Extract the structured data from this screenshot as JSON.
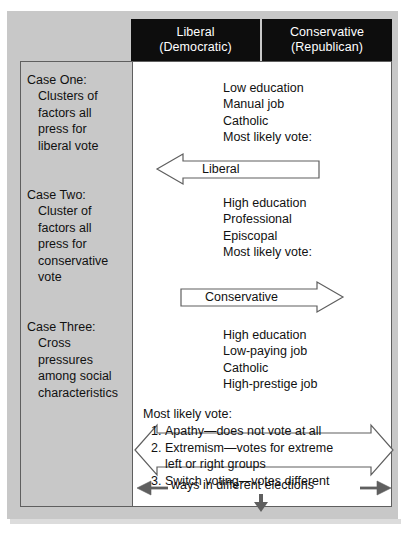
{
  "figure": {
    "colors": {
      "panel_gray": "#c8c8c8",
      "header_black": "#0d0d0d",
      "header_text": "#ffffff",
      "body_white": "#ffffff",
      "line": "#5f5f5f",
      "text": "#111111"
    }
  },
  "header": {
    "columns": [
      {
        "line1": "Liberal",
        "line2": "(Democratic)"
      },
      {
        "line1": "Conservative",
        "line2": "(Republican)"
      }
    ]
  },
  "cases": [
    {
      "title": "Case One:",
      "description_lines": [
        "Clusters of",
        "factors all",
        "press for",
        "liberal vote"
      ],
      "attributes": [
        "Low education",
        "Manual job",
        "Catholic",
        "Most likely vote:"
      ],
      "arrow": {
        "label": "Liberal",
        "direction": "left"
      }
    },
    {
      "title": "Case Two:",
      "description_lines": [
        "Cluster of",
        "factors all",
        "press for",
        "conservative",
        "vote"
      ],
      "attributes": [
        "High education",
        "Professional",
        "Episcopal",
        "Most likely vote:"
      ],
      "arrow": {
        "label": "Conservative",
        "direction": "right"
      }
    },
    {
      "title": "Case Three:",
      "description_lines": [
        "Cross",
        "pressures",
        "among social",
        "characteristics"
      ],
      "attributes": [
        "High education",
        "Low-paying job",
        "Catholic",
        "High-prestige job"
      ],
      "outcome_label": "Most likely vote:",
      "outcomes": [
        {
          "num": "1.",
          "lines": [
            "Apathy—does not vote at all"
          ]
        },
        {
          "num": "2.",
          "lines": [
            "Extremism—votes for extreme",
            "left or right groups"
          ]
        },
        {
          "num": "3.",
          "lines": [
            "Switch voting—votes different",
            "ways in different elections"
          ]
        }
      ]
    }
  ]
}
